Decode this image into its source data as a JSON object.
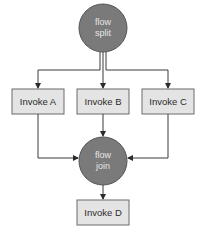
{
  "diagram": {
    "split": {
      "line1": "flow",
      "line2": "split"
    },
    "join": {
      "line1": "flow",
      "line2": "join"
    },
    "tasks": [
      {
        "label": "Invoke A"
      },
      {
        "label": "Invoke B"
      },
      {
        "label": "Invoke C"
      },
      {
        "label": "Invoke D"
      }
    ],
    "colors": {
      "circle_fill": "#7a7a7a",
      "circle_stroke": "#555555",
      "box_fill": "#e4e4e4",
      "box_stroke": "#6a6a6a",
      "line": "#3a3a3a"
    }
  }
}
